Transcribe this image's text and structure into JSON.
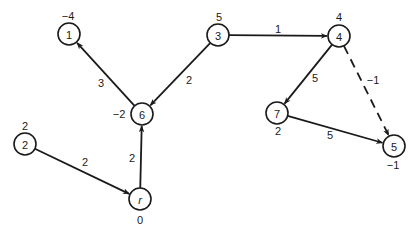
{
  "diagram": {
    "type": "directed-graph",
    "node_radius": 11,
    "colors": {
      "stroke": "#1a1a1a",
      "background": "#ffffff"
    },
    "nodes": [
      {
        "id": "1",
        "label": "1",
        "potential": "−4",
        "x": 69,
        "y": 34,
        "pot_x": 68,
        "pot_y": 16
      },
      {
        "id": "3",
        "label": "3",
        "potential": "5",
        "x": 218,
        "y": 35,
        "pot_x": 219,
        "pot_y": 17
      },
      {
        "id": "4",
        "label": "4",
        "potential": "4",
        "x": 339,
        "y": 36,
        "pot_x": 339,
        "pot_y": 17
      },
      {
        "id": "6",
        "label": "6",
        "potential": "−2",
        "x": 142,
        "y": 114,
        "pot_x": 119,
        "pot_y": 114
      },
      {
        "id": "7",
        "label": "7",
        "potential": "2",
        "x": 277,
        "y": 113,
        "pot_x": 278,
        "pot_y": 131
      },
      {
        "id": "2",
        "label": "2",
        "potential": "2",
        "x": 25,
        "y": 144,
        "pot_x": 25,
        "pot_y": 126
      },
      {
        "id": "5",
        "label": "5",
        "potential": "−1",
        "x": 394,
        "y": 146,
        "pot_x": 393,
        "pot_y": 165
      },
      {
        "id": "r",
        "label": "r",
        "potential": "0",
        "x": 140,
        "y": 199,
        "pot_x": 140,
        "pot_y": 220,
        "italic": true
      }
    ],
    "edges": [
      {
        "from": "6",
        "to": "1",
        "weight": "3",
        "label_x": 101,
        "label_y": 83,
        "dashed": false
      },
      {
        "from": "3",
        "to": "6",
        "weight": "2",
        "label_x": 189,
        "label_y": 80,
        "dashed": false
      },
      {
        "from": "3",
        "to": "4",
        "weight": "1",
        "label_x": 278,
        "label_y": 29,
        "dashed": false
      },
      {
        "from": "4",
        "to": "7",
        "weight": "5",
        "label_x": 315,
        "label_y": 78,
        "dashed": false
      },
      {
        "from": "4",
        "to": "5",
        "weight": "−1",
        "label_x": 373,
        "label_y": 80,
        "dashed": true
      },
      {
        "from": "7",
        "to": "5",
        "weight": "5",
        "label_x": 330,
        "label_y": 135,
        "dashed": false
      },
      {
        "from": "2",
        "to": "r",
        "weight": "2",
        "label_x": 85,
        "label_y": 162,
        "dashed": false
      },
      {
        "from": "r",
        "to": "6",
        "weight": "2",
        "label_x": 132,
        "label_y": 158,
        "dashed": false
      }
    ]
  }
}
